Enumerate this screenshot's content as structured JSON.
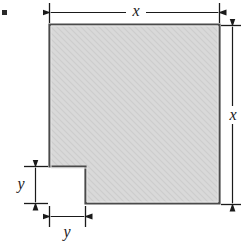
{
  "figure": {
    "type": "engineering-dimension-diagram",
    "bullet_marker": "filled-square",
    "colors": {
      "fill": "#d8d8d8",
      "fill_texture": "#cfcfcf",
      "outline": "#4a4a4a",
      "outline_dark": "#333333",
      "dimension_line": "#1a1a1a",
      "background": "#ffffff"
    },
    "shape": {
      "name": "notched-square",
      "vertices": [
        [
          49,
          24
        ],
        [
          220,
          24
        ],
        [
          220,
          204
        ],
        [
          85,
          204
        ],
        [
          85,
          166
        ],
        [
          49,
          166
        ]
      ]
    },
    "dimensions": [
      {
        "id": "x-top",
        "label": "x",
        "orientation": "horizontal",
        "from": [
          49,
          12
        ],
        "to": [
          220,
          12
        ],
        "arrows": "both"
      },
      {
        "id": "x-right",
        "label": "x",
        "orientation": "vertical",
        "from": [
          232,
          26
        ],
        "to": [
          232,
          204
        ],
        "arrows": "both"
      },
      {
        "id": "y-left",
        "label": "y",
        "orientation": "vertical",
        "from": [
          35,
          166
        ],
        "to": [
          35,
          203
        ],
        "arrows": "both"
      },
      {
        "id": "y-bottom",
        "label": "y",
        "orientation": "horizontal",
        "from": [
          49,
          216
        ],
        "to": [
          85,
          216
        ],
        "arrows": "both"
      }
    ],
    "labels": {
      "x_top": "x",
      "x_right": "x",
      "y_left": "y",
      "y_bottom": "y"
    }
  }
}
